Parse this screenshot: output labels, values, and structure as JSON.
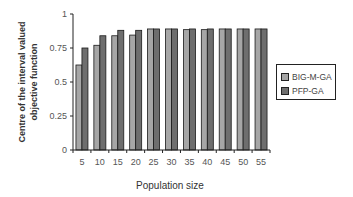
{
  "chart_data": {
    "type": "bar",
    "title": "",
    "xlabel": "Population size",
    "ylabel": "Centre of the interval valued objective function",
    "ylabel_lines": [
      "Centre of the interval valued",
      "objective function"
    ],
    "ylim": [
      0,
      1
    ],
    "yticks": [
      0,
      0.25,
      0.5,
      0.75,
      1
    ],
    "ytick_labels": [
      "0",
      "0.25",
      "0.5",
      "0.75",
      "1"
    ],
    "grid": false,
    "legend_position": "right",
    "categories": [
      "5",
      "10",
      "15",
      "20",
      "25",
      "30",
      "35",
      "40",
      "45",
      "50",
      "55"
    ],
    "series": [
      {
        "name": "BIG-M-GA",
        "color": "#a6a6a6",
        "values": [
          0.625,
          0.77,
          0.84,
          0.845,
          0.89,
          0.89,
          0.885,
          0.885,
          0.89,
          0.89,
          0.89
        ]
      },
      {
        "name": "PFP-GA",
        "color": "#6e6e6e",
        "values": [
          0.75,
          0.84,
          0.88,
          0.88,
          0.89,
          0.89,
          0.89,
          0.89,
          0.89,
          0.89,
          0.89
        ]
      }
    ]
  }
}
